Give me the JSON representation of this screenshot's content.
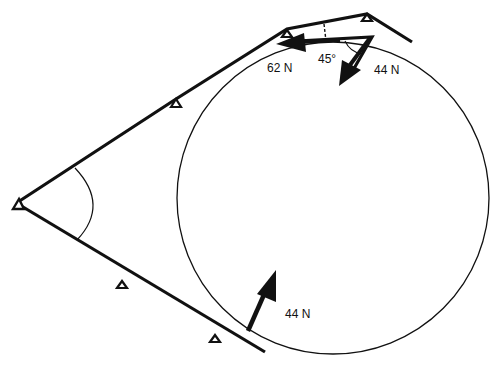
{
  "diagram": {
    "type": "force diagram",
    "labels": {
      "force_top_left": "62 N",
      "angle": "45°",
      "force_top_right": "44 N",
      "force_bottom": "44 N"
    },
    "colors": {
      "stroke": "#111111",
      "background": "#ffffff"
    },
    "elements": {
      "circle": {
        "cx": 333,
        "cy": 198,
        "r": 156
      },
      "apex_pulley": {
        "x": 18,
        "y": 204
      },
      "upper_pulleys": [
        {
          "x": 176,
          "y": 103
        },
        {
          "x": 287,
          "y": 33
        },
        {
          "x": 367,
          "y": 18
        }
      ],
      "lower_pulleys": [
        {
          "x": 122,
          "y": 284
        },
        {
          "x": 215,
          "y": 338
        }
      ]
    }
  }
}
